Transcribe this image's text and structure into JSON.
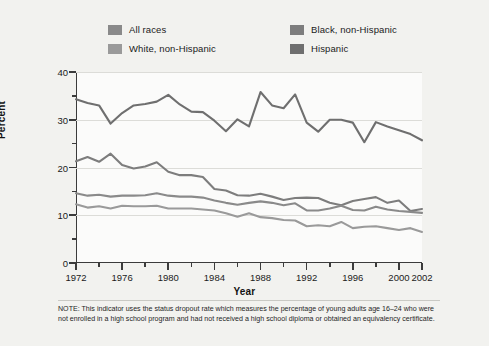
{
  "figure": {
    "background_color": "#f2f2ef",
    "plot_background_color": "#fbfbfa",
    "axis_color": "#3b3b3b",
    "grid_color": "#dcdcd8"
  },
  "legend": {
    "position": "top",
    "items": [
      {
        "label": "All races",
        "color": "#8a8a8a",
        "row": 0,
        "col": 0
      },
      {
        "label": "Black, non-Hispanic",
        "color": "#7d7d7d",
        "row": 0,
        "col": 1
      },
      {
        "label": "White, non-Hispanic",
        "color": "#9a9a9a",
        "row": 1,
        "col": 0
      },
      {
        "label": "Hispanic",
        "color": "#6f6f6f",
        "row": 1,
        "col": 1
      }
    ]
  },
  "note": {
    "text": "NOTE: This indicator uses the status dropout rate which measures the percentage of young adults age 16–24 who were not enrolled in a high school program and had not received a high school diploma or obtained an equivalency certificate."
  },
  "chart_data": {
    "type": "line",
    "title": "",
    "xlabel": "Year",
    "ylabel": "Percent",
    "xlim": [
      1972,
      2002
    ],
    "ylim": [
      0,
      40
    ],
    "ytick_values": [
      0,
      10,
      20,
      30,
      40
    ],
    "ytick_labels": [
      "0",
      "10",
      "20",
      "30",
      "40"
    ],
    "yminor_values": [
      5,
      15,
      25,
      35
    ],
    "grid": "horizontal",
    "xtick_values": [
      1972,
      1976,
      1980,
      1984,
      1988,
      1992,
      1996,
      2000,
      2002
    ],
    "xtick_labels": [
      "1972",
      "1976",
      "1980",
      "1984",
      "1988",
      "1992",
      "1996",
      "2000",
      "2002"
    ],
    "xminor_values": [
      1974,
      1978,
      1982,
      1986,
      1990,
      1994,
      1998
    ],
    "x": [
      1972,
      1973,
      1974,
      1975,
      1976,
      1977,
      1978,
      1979,
      1980,
      1981,
      1982,
      1983,
      1984,
      1985,
      1986,
      1987,
      1988,
      1989,
      1990,
      1991,
      1992,
      1993,
      1994,
      1995,
      1996,
      1997,
      1998,
      1999,
      2000,
      2001,
      2002
    ],
    "series": [
      {
        "name": "Hispanic",
        "color": "#6f6f6f",
        "values": [
          34.3,
          33.5,
          33.0,
          29.2,
          31.4,
          33.0,
          33.3,
          33.8,
          35.2,
          33.2,
          31.7,
          31.6,
          29.8,
          27.6,
          30.1,
          28.6,
          35.8,
          33.0,
          32.4,
          35.3,
          29.4,
          27.5,
          30.0,
          30.0,
          29.4,
          25.3,
          29.5,
          28.6,
          27.8,
          27.0,
          25.7
        ]
      },
      {
        "name": "Black, non-Hispanic",
        "color": "#7d7d7d",
        "values": [
          21.3,
          22.2,
          21.2,
          22.9,
          20.5,
          19.8,
          20.2,
          21.1,
          19.1,
          18.4,
          18.4,
          18.0,
          15.5,
          15.2,
          14.2,
          14.1,
          14.5,
          13.9,
          13.2,
          13.6,
          13.7,
          13.6,
          12.6,
          12.1,
          13.0,
          13.4,
          13.8,
          12.6,
          13.1,
          10.9,
          11.3
        ]
      },
      {
        "name": "All races",
        "color": "#8a8a8a",
        "values": [
          14.6,
          14.1,
          14.3,
          13.9,
          14.1,
          14.1,
          14.2,
          14.6,
          14.1,
          13.9,
          13.9,
          13.7,
          13.1,
          12.6,
          12.2,
          12.6,
          12.9,
          12.6,
          12.1,
          12.5,
          11.0,
          11.0,
          11.4,
          12.0,
          11.1,
          11.0,
          11.8,
          11.2,
          10.9,
          10.7,
          10.5
        ]
      },
      {
        "name": "White, non-Hispanic",
        "color": "#9a9a9a",
        "values": [
          12.3,
          11.6,
          11.9,
          11.4,
          12.0,
          11.9,
          11.9,
          12.0,
          11.4,
          11.4,
          11.4,
          11.2,
          11.0,
          10.4,
          9.7,
          10.4,
          9.6,
          9.4,
          9.0,
          8.9,
          7.7,
          7.9,
          7.7,
          8.6,
          7.3,
          7.6,
          7.7,
          7.3,
          6.9,
          7.3,
          6.5
        ]
      }
    ]
  }
}
